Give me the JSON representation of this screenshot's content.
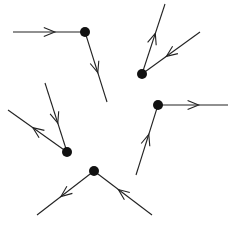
{
  "diagram": {
    "type": "vertex-edge-orientation-diagram",
    "background": "#ffffff",
    "colors": {
      "line": "#222222",
      "vertex": "#111111"
    },
    "vertices": [
      {
        "id": "A",
        "x": 85,
        "y": 32,
        "r": 5,
        "edges": [
          {
            "to": [
              13,
              32
            ],
            "direction": "incoming",
            "arrow_at": 0.5
          },
          {
            "to": [
              107,
              102
            ],
            "direction": "outgoing",
            "arrow_at": 0.5
          }
        ]
      },
      {
        "id": "B",
        "x": 142,
        "y": 74,
        "r": 5,
        "edges": [
          {
            "to": [
              165,
              4
            ],
            "direction": "outgoing",
            "arrow_at": 0.5
          },
          {
            "to": [
              200,
              32
            ],
            "direction": "incoming",
            "arrow_at": 0.5
          }
        ]
      },
      {
        "id": "C",
        "x": 158,
        "y": 105,
        "r": 5,
        "edges": [
          {
            "to": [
              228,
              105
            ],
            "direction": "outgoing",
            "arrow_at": 0.5
          },
          {
            "to": [
              136,
              175
            ],
            "direction": "incoming",
            "arrow_at": 0.5
          }
        ]
      },
      {
        "id": "D",
        "x": 67,
        "y": 152,
        "r": 5,
        "edges": [
          {
            "to": [
              45,
              83
            ],
            "direction": "incoming",
            "arrow_at": 0.5
          },
          {
            "to": [
              8,
              110
            ],
            "direction": "outgoing",
            "arrow_at": 0.5
          }
        ]
      },
      {
        "id": "E",
        "x": 94,
        "y": 171,
        "r": 5,
        "edges": [
          {
            "to": [
              37,
              215
            ],
            "direction": "outgoing",
            "arrow_at": 0.5
          },
          {
            "to": [
              152,
              215
            ],
            "direction": "incoming",
            "arrow_at": 0.5
          }
        ]
      }
    ]
  }
}
